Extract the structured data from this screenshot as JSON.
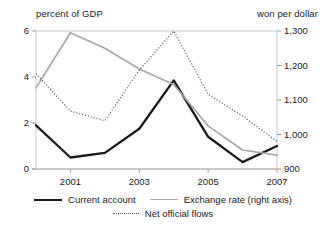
{
  "chart_data": {
    "type": "line",
    "title": "",
    "subtitle": "",
    "xlabel": "",
    "ylabel": "percent of GDP",
    "y2label": "won per dollar",
    "x": [
      2000,
      2001,
      2002,
      2003,
      2004,
      2005,
      2006,
      2007
    ],
    "xtick_labels": [
      "2001",
      "2003",
      "2005",
      "2007"
    ],
    "xtick_values": [
      2001,
      2003,
      2005,
      2007
    ],
    "xlim": [
      2000,
      2007
    ],
    "ylim": [
      0,
      6
    ],
    "ytick_labels": [
      "0",
      "2",
      "4",
      "6"
    ],
    "ytick_values": [
      0,
      2,
      4,
      6
    ],
    "y2lim": [
      1300,
      900
    ],
    "y2_inverted": true,
    "y2tick_labels": [
      "900",
      "1,000",
      "1,100",
      "1,200",
      "1,300"
    ],
    "y2tick_values": [
      900,
      1000,
      1100,
      1200,
      1300
    ],
    "grid": false,
    "legend_position": "bottom",
    "series": [
      {
        "name": "Current account",
        "axis": "left",
        "style": "solid-thick",
        "color": "#1a1a1a",
        "values": [
          1.9,
          0.5,
          0.7,
          1.75,
          3.85,
          1.4,
          0.3,
          1.0
        ]
      },
      {
        "name": "Exchange rate (right axis)",
        "axis": "right",
        "style": "solid-thin",
        "color": "#a8a8a8",
        "values": [
          1135,
          1295,
          1250,
          1190,
          1145,
          1025,
          955,
          940
        ],
        "values_left_scale": [
          2.2,
          0.1,
          0.62,
          1.42,
          2.1,
          3.62,
          5.0,
          5.45
        ]
      },
      {
        "name": "Net official flows",
        "axis": "left",
        "style": "dotted",
        "color": "#5a5a5a",
        "values": [
          4.15,
          2.52,
          2.1,
          4.3,
          6.0,
          3.25,
          2.3,
          1.2
        ]
      }
    ]
  },
  "axes": {
    "left_title": "percent of GDP",
    "right_title": "won per dollar"
  },
  "legend": {
    "row1": [
      {
        "label": "Current account",
        "swatch": "line-solid-thick-black"
      },
      {
        "label": "Exchange rate (right axis)",
        "swatch": "line-solid-thin-gray"
      }
    ],
    "row2": [
      {
        "label": "Net official flows",
        "swatch": "line-dotted-gray"
      }
    ]
  }
}
